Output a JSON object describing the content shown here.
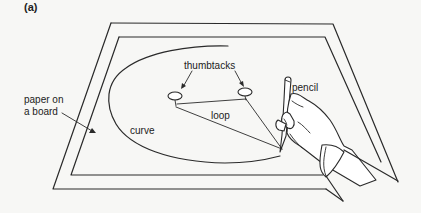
{
  "figure": {
    "panel_label": "(a)",
    "labels": {
      "paper": "paper on\na board",
      "paper_line1": "paper on",
      "paper_line2": "a board",
      "thumbtacks": "thumbtacks",
      "pencil": "pencil",
      "curve": "curve",
      "loop": "loop"
    },
    "colors": {
      "line": "#2a2a2a",
      "background": "#f7f7f5"
    },
    "elements": [
      "board-outer-frame",
      "paper-inner-frame",
      "elliptical-curve",
      "thumbtack-left",
      "thumbtack-right",
      "string-loop",
      "pencil",
      "hand"
    ]
  }
}
